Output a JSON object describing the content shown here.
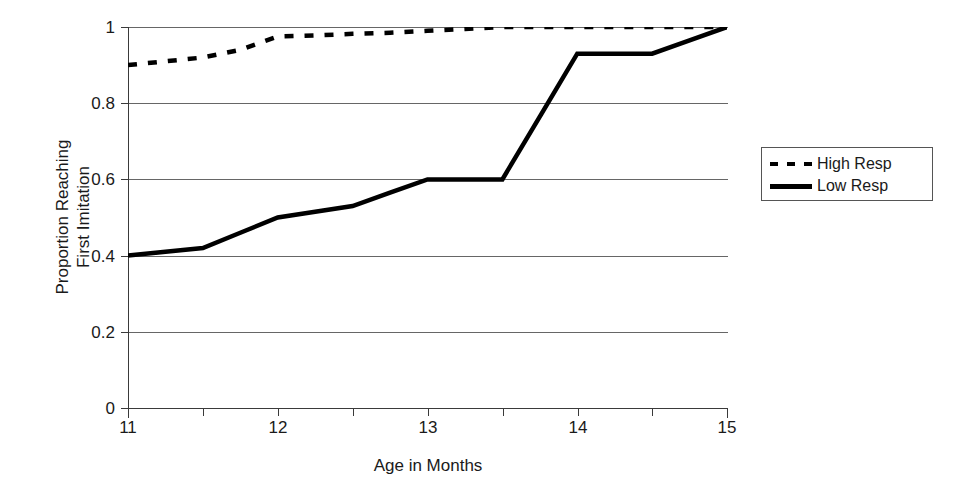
{
  "chart_data": {
    "type": "line",
    "title": "",
    "xlabel": "Age in Months",
    "ylabel": "Proportion Reaching First Imitation",
    "ylabel_line1": "Proportion Reaching",
    "ylabel_line2": "First Imitation",
    "xlim": [
      11,
      15
    ],
    "ylim": [
      0,
      1
    ],
    "grid": true,
    "legend_position": "right",
    "xticks": [
      11,
      11.5,
      12,
      12.5,
      13,
      13.5,
      14,
      14.5,
      15
    ],
    "xtick_labels": [
      "11",
      "",
      "12",
      "",
      "13",
      "",
      "14",
      "",
      "15"
    ],
    "yticks": [
      0,
      0.2,
      0.4,
      0.6,
      0.8,
      1
    ],
    "ytick_labels": [
      "0",
      "0.2",
      "0.4",
      "0.6",
      "0.8",
      "1"
    ],
    "x": [
      11,
      11.25,
      11.5,
      11.75,
      12,
      12.25,
      12.5,
      12.75,
      13,
      13.25,
      13.5,
      13.75,
      14,
      14.25,
      14.5,
      14.75,
      15
    ],
    "series": [
      {
        "name": "High Resp",
        "style": "dashed",
        "color": "#000000",
        "values": [
          0.9,
          0.91,
          0.92,
          0.94,
          0.975,
          0.978,
          0.982,
          0.985,
          0.99,
          0.995,
          1.0,
          1.0,
          1.0,
          1.0,
          1.0,
          1.0,
          1.0
        ]
      },
      {
        "name": "Low Resp",
        "style": "solid",
        "color": "#000000",
        "values": [
          0.4,
          0.41,
          0.42,
          0.46,
          0.5,
          0.515,
          0.53,
          0.565,
          0.6,
          0.6,
          0.6,
          0.765,
          0.93,
          0.93,
          0.93,
          0.965,
          1.0
        ]
      }
    ]
  },
  "legend": {
    "entries": [
      {
        "label": "High Resp",
        "style": "dashed"
      },
      {
        "label": "Low Resp",
        "style": "solid"
      }
    ]
  }
}
